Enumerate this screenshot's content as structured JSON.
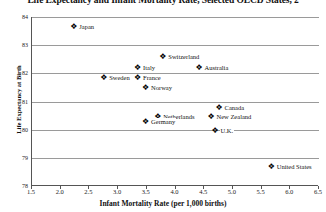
{
  "chart_data": {
    "type": "scatter",
    "title": "Life Expectancy and Infant Mortality Rate, Selected OECD States, 2",
    "xlabel": "Infant Mortality Rate (per 1,000 births)",
    "ylabel": "Life Expectancy at Birth",
    "xlim": [
      1.5,
      6.5
    ],
    "ylim": [
      78,
      84
    ],
    "xticks": [
      "1.5",
      "2.0",
      "2.5",
      "3.0",
      "3.5",
      "4.0",
      "4.5",
      "5.0",
      "5.5",
      "6.0",
      "6.5"
    ],
    "xtick_values": [
      1.5,
      2.0,
      2.5,
      3.0,
      3.5,
      4.0,
      4.5,
      5.0,
      5.5,
      6.0,
      6.5
    ],
    "yticks": [
      "84",
      "83",
      "82",
      "81",
      "80",
      "79",
      "78"
    ],
    "ytick_values": [
      84,
      83,
      82,
      81,
      80,
      79,
      78
    ],
    "grid": "horizontal",
    "legend": "none",
    "marker": "diamond",
    "marker_color": "#000000",
    "points": [
      {
        "label": "Japan",
        "x": 2.22,
        "y": 83.65
      },
      {
        "label": "Switzerland",
        "x": 3.77,
        "y": 82.58
      },
      {
        "label": "Italy",
        "x": 3.33,
        "y": 82.18
      },
      {
        "label": "Australia",
        "x": 4.4,
        "y": 82.18
      },
      {
        "label": "Sweden",
        "x": 2.74,
        "y": 81.82
      },
      {
        "label": "France",
        "x": 3.33,
        "y": 81.82
      },
      {
        "label": "Norway",
        "x": 3.47,
        "y": 81.47
      },
      {
        "label": "Canada",
        "x": 4.75,
        "y": 80.76
      },
      {
        "label": "Netherlands",
        "x": 3.68,
        "y": 80.44
      },
      {
        "label": "New Zealand",
        "x": 4.61,
        "y": 80.44
      },
      {
        "label": "Germany",
        "x": 3.47,
        "y": 80.26
      },
      {
        "label": "U.K.",
        "x": 4.68,
        "y": 79.95
      },
      {
        "label": "United States",
        "x": 5.66,
        "y": 78.68
      }
    ]
  }
}
